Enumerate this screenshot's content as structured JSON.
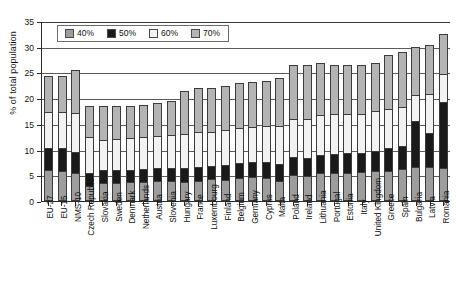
{
  "chart_data": {
    "type": "bar",
    "title": "",
    "subtitle": "",
    "xlabel": "",
    "ylabel": "% of total population",
    "ylim": [
      0,
      35
    ],
    "yticks": [
      0,
      5,
      10,
      15,
      20,
      25,
      30,
      35
    ],
    "ytick_labels": [
      "0",
      "5",
      "10",
      "15",
      "20",
      "25",
      "30",
      "35"
    ],
    "grid": true,
    "stacked": true,
    "legend_position": "top-left",
    "legend": [
      "40%",
      "50%",
      "60%",
      "70%"
    ],
    "series_colors": {
      "40%": "#9d9d9d",
      "50%": "#1a1a1a",
      "60%": "#f2f2f2",
      "70%": "#b4b4b4"
    },
    "categories": [
      "EU-27",
      "EU-15",
      "NMS-10",
      "Czech Republic",
      "Slovakia",
      "Sweden",
      "Denmark",
      "Netherlands",
      "Austria",
      "Slovenia",
      "Hungary",
      "France",
      "Luxembourg",
      "Finland",
      "Belgium",
      "Germany",
      "Cyprus",
      "Malta",
      "Poland",
      "Ireland",
      "Lithuania",
      "Portugal",
      "Estonia",
      "Italy",
      "United Kingdom",
      "Greece",
      "Spain",
      "Bulgaria",
      "Latvia",
      "Romania"
    ],
    "series": [
      {
        "name": "40%",
        "values": [
          5.7,
          5.5,
          5.0,
          2.5,
          3.1,
          3.2,
          3.4,
          3.3,
          3.6,
          3.5,
          3.3,
          3.6,
          3.8,
          3.7,
          4.0,
          4.2,
          4.1,
          3.6,
          4.6,
          4.4,
          5.0,
          5.0,
          5.1,
          5.2,
          5.5,
          5.5,
          5.8,
          6.2,
          6.3,
          6.0
        ]
      },
      {
        "name": "50%",
        "values": [
          4.3,
          4.5,
          4.2,
          2.5,
          2.5,
          2.5,
          2.3,
          2.5,
          2.5,
          2.6,
          2.8,
          2.7,
          2.6,
          2.9,
          3.0,
          3.0,
          3.1,
          3.2,
          3.6,
          3.6,
          3.6,
          3.8,
          3.8,
          3.7,
          3.9,
          4.5,
          4.6,
          9.0,
          6.5,
          12.8
        ]
      },
      {
        "name": "60%",
        "values": [
          7.0,
          7.0,
          7.5,
          7.0,
          5.8,
          6.0,
          6.2,
          6.2,
          6.2,
          6.3,
          6.5,
          6.8,
          6.6,
          6.8,
          6.8,
          6.9,
          7.0,
          7.4,
          7.4,
          7.6,
          7.8,
          7.7,
          7.6,
          7.6,
          7.7,
          7.5,
          7.5,
          5.0,
          7.6,
          5.6
        ]
      },
      {
        "name": "70%",
        "values": [
          7.0,
          7.0,
          8.3,
          6.0,
          6.6,
          6.3,
          6.1,
          6.3,
          6.4,
          6.6,
          8.4,
          8.4,
          8.5,
          8.6,
          8.7,
          8.6,
          8.8,
          9.3,
          10.4,
          10.4,
          10.1,
          9.5,
          9.5,
          9.5,
          9.4,
          10.5,
          10.6,
          9.3,
          9.5,
          7.6
        ]
      }
    ]
  }
}
